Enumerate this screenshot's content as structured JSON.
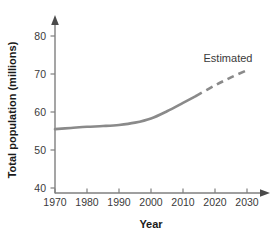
{
  "chart_data": {
    "type": "line",
    "title": "",
    "xlabel": "Year",
    "ylabel": "Total population (millions)",
    "xlim": [
      1970,
      2030
    ],
    "ylim": [
      40,
      80
    ],
    "grid": false,
    "legend_position": "none",
    "x_ticks": [
      "1970",
      "1980",
      "1990",
      "2000",
      "2010",
      "2020",
      "2030"
    ],
    "y_ticks": [
      "40",
      "50",
      "60",
      "70",
      "80"
    ],
    "x_tick_values": [
      1970,
      1980,
      1990,
      2000,
      2010,
      2020,
      2030
    ],
    "y_tick_values": [
      40,
      50,
      60,
      70,
      80
    ],
    "annotations": [
      {
        "text": "Estimated",
        "x": 2022,
        "y": 76
      }
    ],
    "series": [
      {
        "name": "Actual",
        "style": "solid",
        "x": [
          1970,
          1975,
          1980,
          1985,
          1990,
          1995,
          2000,
          2005,
          2010,
          2014
        ],
        "values": [
          55.5,
          55.8,
          56.1,
          56.3,
          56.6,
          57.2,
          58.3,
          60.2,
          62.4,
          64.2
        ]
      },
      {
        "name": "Estimated",
        "style": "dashed",
        "x": [
          2014,
          2020,
          2025,
          2030
        ],
        "values": [
          64.2,
          67.0,
          69.1,
          71.0
        ]
      }
    ]
  },
  "axis": {
    "x_arrow": "arrow-right-icon",
    "y_arrow": "arrow-up-icon"
  }
}
